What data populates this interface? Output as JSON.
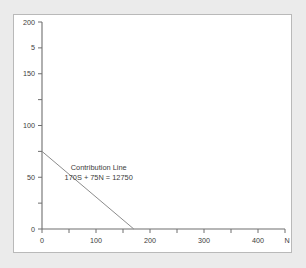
{
  "figure": {
    "background_color": "#ebebeb",
    "panel_color": "#ffffff",
    "panel_border_color": "#b9b9b9"
  },
  "chart_data": {
    "type": "line",
    "title": "",
    "subtitle": "",
    "xlabel": "N",
    "ylabel": "",
    "xlim": [
      0,
      450
    ],
    "ylim": [
      0,
      200
    ],
    "grid": false,
    "legend_position": "none",
    "x_ticks": [
      0,
      50,
      100,
      150,
      200,
      250,
      300,
      350,
      400,
      450
    ],
    "x_tick_labels": [
      "0",
      "",
      "100",
      "",
      "200",
      "",
      "300",
      "",
      "400",
      ""
    ],
    "y_ticks": [
      0,
      25,
      50,
      75,
      100,
      125,
      150,
      175,
      200
    ],
    "y_tick_labels": [
      "0",
      "",
      "50",
      "",
      "100",
      "",
      "150",
      "5",
      "200"
    ],
    "series": [
      {
        "name": "Contribution Line",
        "color": "#8c8c8c",
        "x": [
          0,
          170
        ],
        "y": [
          75,
          0
        ]
      }
    ],
    "annotations": [
      {
        "name": "contribution-line-label",
        "line1": "Contribution Line",
        "line2": "170S + 75N = 12750",
        "x": 105,
        "y": 57
      }
    ],
    "axis_labels": {
      "x_axis_name": "N",
      "y_axis_name": ""
    }
  }
}
